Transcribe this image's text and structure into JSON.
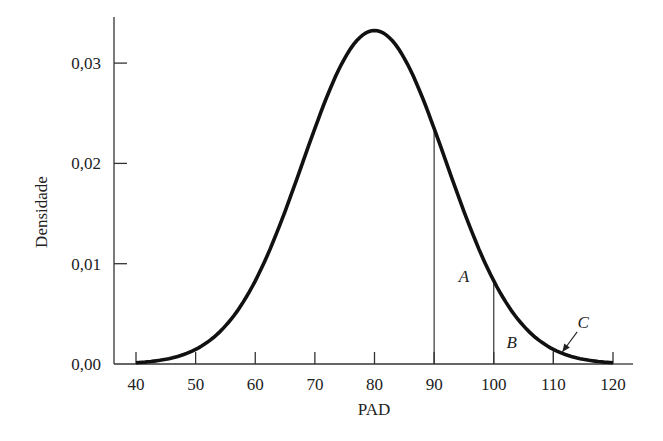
{
  "chart_data": {
    "type": "line",
    "title": "",
    "xlabel": "PAD",
    "ylabel": "Densidade",
    "xlim": [
      40,
      120
    ],
    "ylim": [
      0,
      0.033
    ],
    "x_ticks": [
      40,
      50,
      60,
      70,
      80,
      90,
      100,
      110,
      120
    ],
    "x_tick_labels": [
      "40",
      "50",
      "60",
      "70",
      "80",
      "90",
      "100",
      "110",
      "120"
    ],
    "y_ticks": [
      0,
      0.01,
      0.02,
      0.03
    ],
    "y_tick_labels": [
      "0,00",
      "0,01",
      "0,02",
      "0,03"
    ],
    "grid": false,
    "legend": null,
    "series": [
      {
        "name": "Densidade normal (média 80, dp 12)",
        "distribution": {
          "mean": 80,
          "sd": 12
        },
        "x": [
          40,
          45,
          50,
          55,
          60,
          65,
          70,
          75,
          80,
          85,
          90,
          95,
          100,
          105,
          110,
          115,
          120
        ],
        "values": [
          0.0005,
          0.0013,
          0.0032,
          0.006,
          0.0084,
          0.0154,
          0.0234,
          0.0301,
          0.0332,
          0.0301,
          0.0234,
          0.0154,
          0.0084,
          0.0038,
          0.0015,
          0.0005,
          0.0001
        ]
      }
    ],
    "vertical_lines": [
      {
        "x": 90,
        "y_top": 0.0225
      },
      {
        "x": 100,
        "y_top": 0.0082
      },
      {
        "x": 110,
        "y_top": 0.0016
      }
    ],
    "annotations": [
      {
        "label": "A",
        "x": 95,
        "y": 0.0088,
        "region": "90–100"
      },
      {
        "label": "B",
        "x": 103,
        "y": 0.0022,
        "region": "100–110"
      },
      {
        "label": "C",
        "x": 115,
        "y": 0.0042,
        "region": ">110",
        "arrow_to": [
          111.5,
          0.0012
        ]
      }
    ]
  }
}
